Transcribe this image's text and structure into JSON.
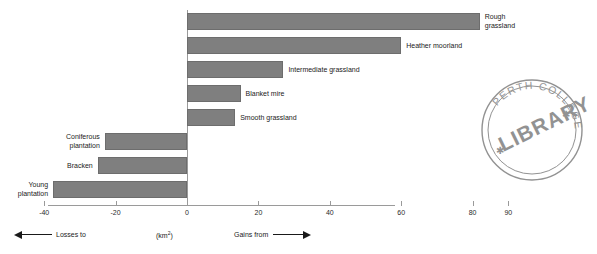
{
  "chart_data": {
    "type": "bar",
    "orientation": "horizontal",
    "title": "",
    "xlabel": "(km2)",
    "ylabel": "",
    "xlim": [
      -40,
      90
    ],
    "xticks": [
      -40,
      -20,
      0,
      20,
      40,
      60,
      80,
      90
    ],
    "xtick_labels": [
      "-40",
      "-20",
      "0",
      "20",
      "40",
      "60",
      "80",
      "90"
    ],
    "grid": false,
    "legend": null,
    "categories": [
      "Rough grassland",
      "Heather moorland",
      "Intermediate grassland",
      "Blanket mire",
      "Smooth grassland",
      "Coniferous plantation",
      "Bracken",
      "Young plantation"
    ],
    "values": [
      82,
      60,
      27,
      15,
      13.5,
      -23,
      -25,
      -37.5
    ],
    "bar_color": "#7f7f7f",
    "annotations": {
      "left_direction": "Losses to",
      "right_direction": "Gains from",
      "unit": "(km2)"
    }
  },
  "axis": {
    "unit_label": "(km",
    "unit_sup": "2",
    "unit_close": ")",
    "ticks": [
      {
        "value": -40,
        "label": "-40"
      },
      {
        "value": -20,
        "label": "-20"
      },
      {
        "value": 0,
        "label": "0"
      },
      {
        "value": 20,
        "label": "20"
      },
      {
        "value": 40,
        "label": "40"
      },
      {
        "value": 60,
        "label": "60"
      },
      {
        "value": 80,
        "label": "80"
      },
      {
        "value": 90,
        "label": "90"
      }
    ],
    "losses_label": "Losses to",
    "gains_label": "Gains from"
  },
  "bars": [
    {
      "label": "Rough\ngrassland",
      "value": 82,
      "side": "right"
    },
    {
      "label": "Heather moorland",
      "value": 60,
      "side": "right"
    },
    {
      "label": "Intermediate grassland",
      "value": 27,
      "side": "right"
    },
    {
      "label": "Blanket mire",
      "value": 15,
      "side": "right"
    },
    {
      "label": "Smooth grassland",
      "value": 13.5,
      "side": "right"
    },
    {
      "label": "Coniferous\nplantation",
      "value": -23,
      "side": "left"
    },
    {
      "label": "Bracken",
      "value": -25,
      "side": "left"
    },
    {
      "label": "Young\nplantation",
      "value": -37.5,
      "side": "left"
    }
  ],
  "stamp": {
    "top_text": "PERTH COLLEGE",
    "center_text": "LIBRARY",
    "star_glyph": "✱"
  }
}
